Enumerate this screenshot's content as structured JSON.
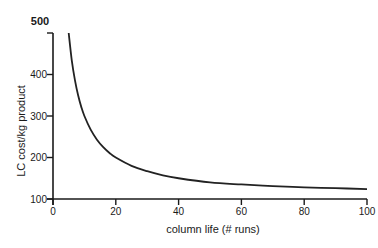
{
  "chart_data": {
    "type": "line",
    "title": "",
    "xlabel": "column life (# runs)",
    "ylabel": "LC cost/kg product",
    "xlim": [
      0,
      100
    ],
    "ylim": [
      100,
      500
    ],
    "grid": false,
    "legend": null,
    "x_ticks": [
      0,
      20,
      40,
      60,
      80,
      100
    ],
    "y_ticks": [
      100,
      200,
      300,
      400,
      500
    ],
    "x_tick_labels": [
      "0",
      "20",
      "40",
      "60",
      "80",
      "100"
    ],
    "y_tick_labels": [
      "100",
      "200",
      "300",
      "400",
      "500"
    ],
    "series": [
      {
        "name": "LC cost/kg product",
        "x": [
          5,
          6,
          7,
          8,
          9,
          10,
          12,
          14,
          16,
          18,
          20,
          25,
          30,
          35,
          40,
          50,
          60,
          70,
          80,
          90,
          100
        ],
        "values": [
          500,
          433,
          386,
          350,
          322,
          300,
          267,
          243,
          225,
          211,
          200,
          180,
          167,
          157,
          150,
          140,
          135,
          131,
          128,
          126,
          124
        ]
      }
    ]
  },
  "layout": {
    "plot_left": 53,
    "plot_right": 367,
    "plot_top": 33,
    "plot_bottom": 199,
    "line_color": "#222222"
  }
}
